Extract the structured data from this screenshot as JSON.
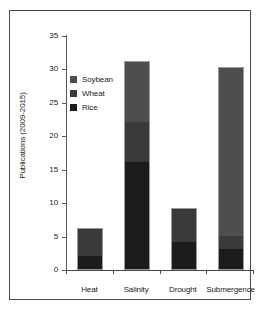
{
  "chart_data": {
    "type": "bar",
    "subtype": "stacked-bar",
    "title": "",
    "xlabel": "",
    "ylabel": "Publications (2009-2015)",
    "ylim": [
      0,
      35
    ],
    "yticks": [
      0,
      5,
      10,
      15,
      20,
      25,
      30,
      35
    ],
    "grid": false,
    "legend_position": "inside-upper-left",
    "categories": [
      "Heat",
      "Salinity",
      "Drought",
      "Submergence"
    ],
    "series": [
      {
        "name": "Rice",
        "color": "#1c1c1c",
        "values": [
          2,
          16,
          4,
          3
        ]
      },
      {
        "name": "Wheat",
        "color": "#3a3a3a",
        "values": [
          4,
          6,
          5,
          2
        ]
      },
      {
        "name": "Soybean",
        "color": "#4e4e4e",
        "values": [
          0,
          9,
          0,
          25
        ]
      }
    ],
    "totals": [
      6,
      31,
      9,
      30
    ],
    "stack_order_bottom_to_top": [
      "Rice",
      "Wheat",
      "Soybean"
    ],
    "legend_order_top_to_bottom": [
      "Soybean",
      "Wheat",
      "Rice"
    ]
  },
  "axis": {
    "y_tick_labels": [
      "0",
      "5",
      "10",
      "15",
      "20",
      "25",
      "30",
      "35"
    ],
    "y_title": "Publications (2009-2015)",
    "x_tick_labels": [
      "Heat",
      "Salinity",
      "Drought",
      "Submergence"
    ]
  },
  "legend": {
    "items": [
      {
        "label": "Soybean",
        "swatch_color": "#4e4e4e"
      },
      {
        "label": "Wheat",
        "swatch_color": "#3a3a3a"
      },
      {
        "label": "Rice",
        "swatch_color": "#1c1c1c"
      }
    ]
  },
  "colors": {
    "frame": "#4a4a4a",
    "axis": "#4a4a4a",
    "text": "#1a1a1a",
    "background": "#ffffff",
    "bar_outline": "#9a9a9a"
  }
}
